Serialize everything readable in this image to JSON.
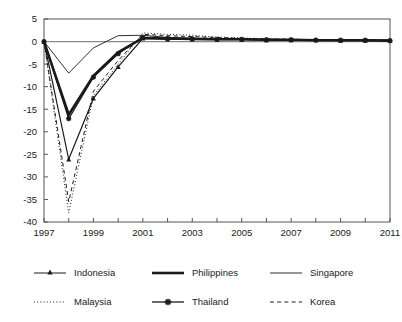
{
  "chart_data": {
    "type": "line",
    "title": "",
    "subtitle": "",
    "xlabel": "",
    "ylabel": "",
    "x": [
      1997,
      1998,
      1999,
      2000,
      2001,
      2002,
      2003,
      2004,
      2005,
      2006,
      2007,
      2008,
      2009,
      2010,
      2011
    ],
    "xlim": [
      1997,
      2011
    ],
    "ylim": [
      -40,
      5
    ],
    "yticks": [
      5,
      0,
      -5,
      -10,
      -15,
      -20,
      -25,
      -30,
      -35,
      -40
    ],
    "ytick_labels": [
      "5",
      "0",
      "-5",
      "-10",
      "-15",
      "-20",
      "-25",
      "-30",
      "-35",
      "-40"
    ],
    "xticks": [
      1997,
      1998,
      1999,
      2000,
      2001,
      2002,
      2003,
      2004,
      2005,
      2006,
      2007,
      2008,
      2009,
      2010,
      2011
    ],
    "xtick_labels": [
      "1997",
      "",
      "1999",
      "",
      "2001",
      "",
      "2003",
      "",
      "2005",
      "",
      "2007",
      "",
      "2009",
      "",
      "2011"
    ],
    "grid": false,
    "zero_line": true,
    "legend_position": "below",
    "series": [
      {
        "name": "Indonesia",
        "style": "solid-thin-marker",
        "marker": "triangle",
        "values": [
          0.0,
          -26.1,
          -12.6,
          -5.6,
          0.7,
          0.5,
          0.5,
          0.4,
          0.4,
          0.3,
          0.3,
          0.3,
          0.2,
          0.2,
          0.2
        ]
      },
      {
        "name": "Philippines",
        "style": "solid-thick",
        "marker": "none",
        "values": [
          0.0,
          -16.2,
          -7.6,
          -2.4,
          0.8,
          0.7,
          0.6,
          0.5,
          0.5,
          0.4,
          0.4,
          0.3,
          0.3,
          0.3,
          0.2
        ]
      },
      {
        "name": "Singapore",
        "style": "solid-thin",
        "marker": "none",
        "values": [
          0.0,
          -7.0,
          -1.4,
          1.3,
          1.4,
          0.9,
          0.7,
          0.6,
          0.6,
          0.5,
          0.4,
          0.4,
          0.3,
          0.3,
          0.3
        ]
      },
      {
        "name": "Malaysia",
        "style": "dotted",
        "marker": "none",
        "values": [
          0.0,
          -38.0,
          -12.0,
          -5.0,
          1.9,
          1.6,
          1.4,
          1.0,
          0.8,
          0.6,
          0.5,
          0.4,
          0.4,
          0.3,
          0.3
        ]
      },
      {
        "name": "Thailand",
        "style": "solid-thin-marker",
        "marker": "star",
        "values": [
          0.0,
          -17.1,
          -7.9,
          -2.7,
          0.9,
          0.7,
          0.6,
          0.5,
          0.5,
          0.4,
          0.4,
          0.3,
          0.3,
          0.3,
          0.2
        ]
      },
      {
        "name": "Korea",
        "style": "dashed",
        "marker": "none",
        "values": [
          0.0,
          -35.5,
          -11.0,
          -4.2,
          1.6,
          1.3,
          1.1,
          0.9,
          0.7,
          0.6,
          0.5,
          0.4,
          0.4,
          0.3,
          0.3
        ]
      }
    ]
  },
  "legend": {
    "entries": [
      {
        "label": "Indonesia",
        "swatch": "line-triangle-marker"
      },
      {
        "label": "Philippines",
        "swatch": "line-thick"
      },
      {
        "label": "Singapore",
        "swatch": "line-thin"
      },
      {
        "label": "Malaysia",
        "swatch": "line-dotted"
      },
      {
        "label": "Thailand",
        "swatch": "line-star-marker"
      },
      {
        "label": "Korea",
        "swatch": "line-dashed"
      }
    ]
  },
  "colors": {
    "line": "#1a1a1a",
    "axis": "#555555",
    "zero_line": "#8a8a8a",
    "background": "#ffffff"
  }
}
